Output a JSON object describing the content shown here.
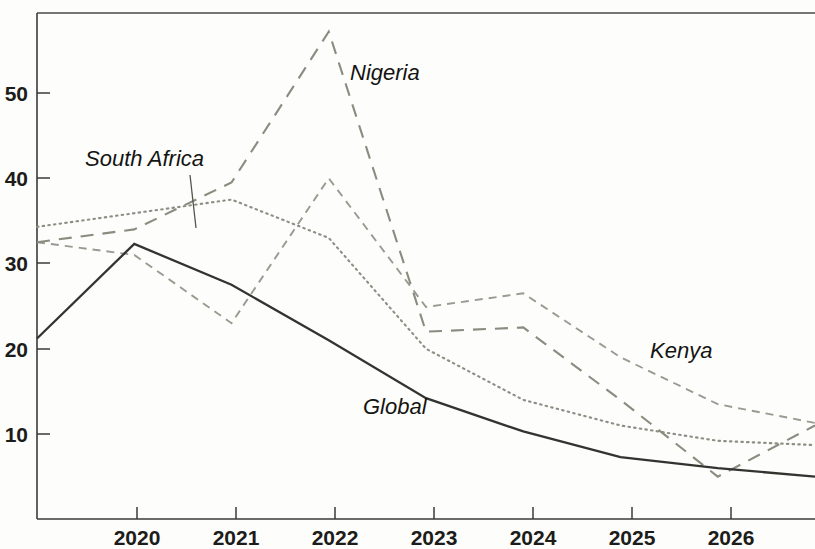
{
  "chart_data": {
    "type": "line",
    "title": "",
    "subtitle": "",
    "xlabel": "",
    "ylabel": "",
    "x": [
      2019,
      2020,
      2021,
      2022,
      2023,
      2024,
      2025,
      2026,
      2027
    ],
    "xtick_labels": [
      "2020",
      "2021",
      "2022",
      "2023",
      "2024",
      "2025",
      "2026"
    ],
    "xtick_values": [
      2020,
      2021,
      2022,
      2023,
      2024,
      2025,
      2026
    ],
    "ytick_labels": [
      "10",
      "20",
      "30",
      "40",
      "50"
    ],
    "ytick_values": [
      10,
      20,
      30,
      40,
      50
    ],
    "xlim": [
      2019,
      2027
    ],
    "ylim": [
      2,
      58.5
    ],
    "grid": false,
    "legend_position": "inline-annotations",
    "series": [
      {
        "name": "Global",
        "style": "solid",
        "color": "#33332f",
        "values": [
          21.2,
          32.3,
          27.5,
          21.0,
          14.2,
          10.3,
          7.3,
          6.0,
          5.0
        ]
      },
      {
        "name": "South Africa",
        "style": "dotted",
        "color": "#8e8e84",
        "values": [
          34.3,
          35.9,
          37.5,
          33.0,
          20.0,
          14.0,
          11.0,
          9.2,
          8.7
        ]
      },
      {
        "name": "Nigeria",
        "style": "long-dash",
        "color": "#8b8b80",
        "values": [
          32.5,
          34.0,
          39.5,
          57.2,
          22.0,
          22.5,
          14.0,
          5.0,
          11.0
        ]
      },
      {
        "name": "Kenya",
        "style": "short-dash",
        "color": "#9a9a90",
        "values": [
          32.5,
          31.0,
          23.0,
          40.0,
          24.9,
          26.5,
          19.0,
          13.5,
          11.3
        ]
      }
    ],
    "annotations": [
      {
        "text": "South Africa",
        "series": "South Africa",
        "x": 155,
        "y": 166,
        "leader": true
      },
      {
        "text": "Nigeria",
        "series": "Nigeria",
        "x": 350,
        "y": 80,
        "leader": false
      },
      {
        "text": "Global",
        "series": "Global",
        "x": 363,
        "y": 414,
        "leader": false
      },
      {
        "text": "Kenya",
        "series": "Kenya",
        "x": 650,
        "y": 358,
        "leader": false
      }
    ]
  }
}
